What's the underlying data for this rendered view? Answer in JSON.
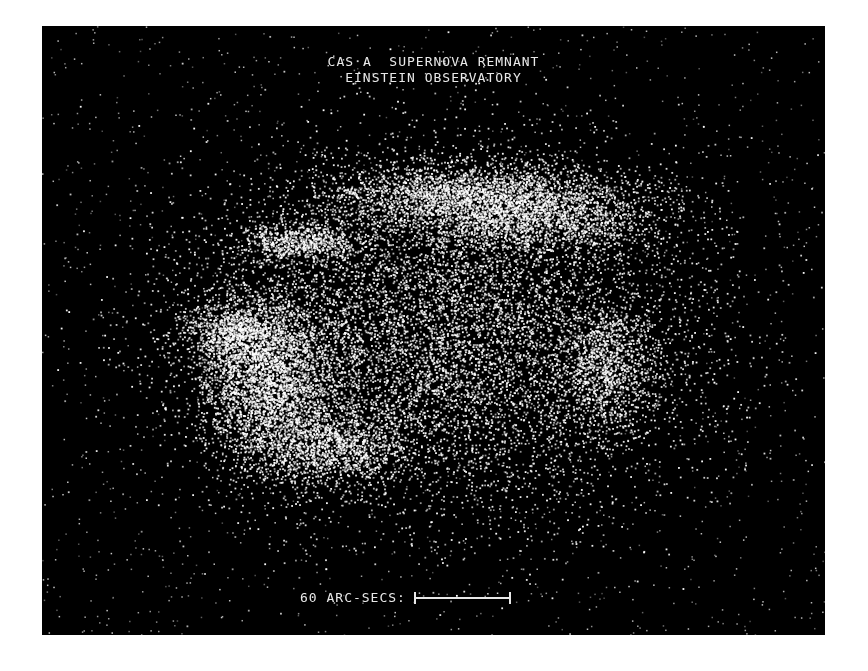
{
  "image": {
    "title_line1": "CAS A  SUPERNOVA REMNANT",
    "title_line2": "EINSTEIN OBSERVATORY",
    "scale_label": "60 ARC-SECS:",
    "colors": {
      "background": "#000000",
      "emission": "#ffffff",
      "border": "#ffffff"
    },
    "frame": {
      "x": 42,
      "y": 26,
      "width": 783,
      "height": 609
    },
    "emission_regions": [
      {
        "name": "north-rim",
        "cx": 430,
        "cy": 170,
        "rx": 140,
        "ry": 32,
        "density": 2600
      },
      {
        "name": "north-east-arc",
        "cx": 500,
        "cy": 195,
        "rx": 110,
        "ry": 35,
        "density": 1400
      },
      {
        "name": "north-west-knot",
        "cx": 255,
        "cy": 215,
        "rx": 55,
        "ry": 18,
        "density": 700
      },
      {
        "name": "west-bright-lobe",
        "cx": 225,
        "cy": 355,
        "rx": 60,
        "ry": 80,
        "density": 3000
      },
      {
        "name": "west-rim",
        "cx": 190,
        "cy": 305,
        "rx": 50,
        "ry": 30,
        "density": 900
      },
      {
        "name": "south-west-arc",
        "cx": 290,
        "cy": 420,
        "rx": 65,
        "ry": 35,
        "density": 1100
      },
      {
        "name": "east-rim",
        "cx": 565,
        "cy": 340,
        "rx": 45,
        "ry": 55,
        "density": 1000
      },
      {
        "name": "diffuse-shell",
        "cx": 400,
        "cy": 310,
        "rx": 230,
        "ry": 160,
        "density": 9000
      }
    ],
    "background_noise_points": 1800
  }
}
